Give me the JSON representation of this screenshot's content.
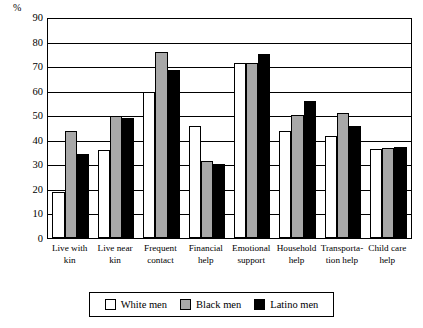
{
  "chart_data": {
    "type": "bar",
    "title": "",
    "subtitle": "",
    "xlabel": "",
    "ylabel": "%",
    "ylim": [
      0,
      90
    ],
    "ytick_labels": [
      "90",
      "80",
      "70",
      "60",
      "50",
      "40",
      "30",
      "20",
      "10",
      "0"
    ],
    "ytick_values": [
      90,
      80,
      70,
      60,
      50,
      40,
      30,
      20,
      10,
      0
    ],
    "grid": true,
    "legend_position": "bottom",
    "categories": [
      "Live with kin",
      "Live near kin",
      "Frequent contact",
      "Financial help",
      "Emotional support",
      "Household help",
      "Transportation help",
      "Child care help"
    ],
    "category_lines": [
      [
        "Live with",
        "kin"
      ],
      [
        "Live near",
        "kin"
      ],
      [
        "Frequent",
        "contact"
      ],
      [
        "Financial",
        "help"
      ],
      [
        "Emotional",
        "support"
      ],
      [
        "Household",
        "help"
      ],
      [
        "Transporta-",
        "tion help"
      ],
      [
        "Child care",
        "help"
      ]
    ],
    "series": [
      {
        "name": "White men",
        "color": "#ffffff",
        "values": [
          19,
          36,
          60,
          46,
          72,
          44,
          42,
          36.5
        ]
      },
      {
        "name": "Black men",
        "color": "#a8a8a8",
        "values": [
          44,
          50,
          76.5,
          31.5,
          72,
          50.5,
          51.5,
          37
        ]
      },
      {
        "name": "Latino men",
        "color": "#000000",
        "values": [
          34.5,
          49.5,
          69,
          30.5,
          75.5,
          56.5,
          46,
          37.5
        ]
      }
    ]
  },
  "legend": {
    "items": [
      {
        "label": "White men",
        "swatch": "white-swatch-icon"
      },
      {
        "label": "Black men",
        "swatch": "gray-swatch-icon"
      },
      {
        "label": "Latino men",
        "swatch": "black-swatch-icon"
      }
    ]
  }
}
